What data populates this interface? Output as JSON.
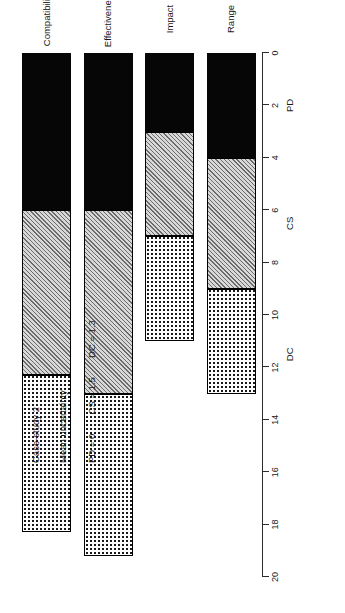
{
  "annotations": {
    "title": "Case-study 2",
    "subtitle": "Mean uncertainty",
    "pd_value": "PD = 0",
    "cs_value": "CS = 1.5",
    "dc_value": "DC = 1.3"
  },
  "chart_data": {
    "type": "bar",
    "orientation": "horizontal-rotated",
    "title": "Case-study 2",
    "subtitle": "Mean uncertainty",
    "xlabel": "",
    "ylabel": "",
    "categories": [
      "Range",
      "Impact",
      "Effectiveness",
      "Compatibility"
    ],
    "stacked": true,
    "value_axis": {
      "min": 0,
      "max": 20,
      "ticks": [
        0,
        2,
        4,
        6,
        8,
        10,
        12,
        14,
        16,
        18,
        20
      ],
      "tick_labels": [
        "0",
        "2",
        "4",
        "6",
        "8",
        "10",
        "12",
        "14",
        "16",
        "18",
        "20"
      ],
      "secondary_labels": [
        {
          "text": "PD",
          "at": 2
        },
        {
          "text": "CS",
          "at": 6.5
        },
        {
          "text": "DC",
          "at": 11.5
        }
      ],
      "grid": false
    },
    "series": [
      {
        "name": "PD",
        "fill": "black",
        "values": [
          4.0,
          3.0,
          6.0,
          6.0
        ]
      },
      {
        "name": "CS",
        "fill": "grey-hatched",
        "values": [
          5.0,
          4.0,
          7.0,
          6.3
        ]
      },
      {
        "name": "DC",
        "fill": "white-dotted",
        "values": [
          4.0,
          4.0,
          6.2,
          6.0
        ]
      }
    ],
    "segment_boundaries": [
      {
        "category": "Range",
        "pd": [
          0,
          4.0
        ],
        "cs": [
          4.0,
          9.0
        ],
        "dc": [
          9.0,
          13.0
        ]
      },
      {
        "category": "Impact",
        "pd": [
          0,
          3.0
        ],
        "cs": [
          3.0,
          7.0
        ],
        "dc": [
          7.0,
          11.0
        ]
      },
      {
        "category": "Effectiveness",
        "pd": [
          0,
          6.0
        ],
        "cs": [
          6.0,
          13.0
        ],
        "dc": [
          13.0,
          19.2
        ]
      },
      {
        "category": "Compatibility",
        "pd": [
          0,
          6.0
        ],
        "cs": [
          6.0,
          12.3
        ],
        "dc": [
          12.3,
          18.3
        ]
      }
    ],
    "totals": [
      13.0,
      11.0,
      19.2,
      18.3
    ],
    "annotation_values": {
      "PD": 0,
      "CS": 1.5,
      "DC": 1.3
    },
    "legend": {
      "visible": false,
      "position": "none"
    }
  },
  "colors": {
    "axis": "#2b2b2b",
    "pd_fill": "#060606",
    "cs_fill": "#d8d8d8",
    "dc_fill": "#fdfdfd",
    "outline": "#000000",
    "background": "#ffffff"
  }
}
